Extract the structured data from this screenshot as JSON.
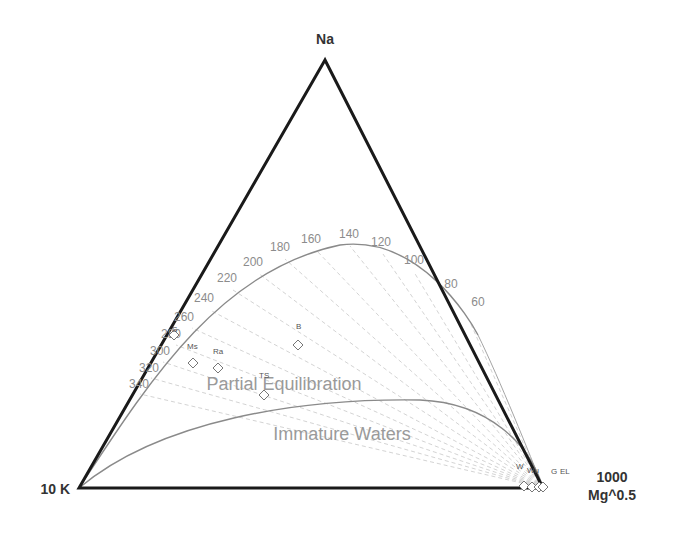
{
  "diagram": {
    "type": "ternary",
    "vertices": {
      "top": "Na",
      "bottom_left": "10 K",
      "bottom_right_line1": "1000",
      "bottom_right_line2": "Mg^0.5"
    },
    "regions": {
      "partial": "Partial Equilibration",
      "immature": "Immature Waters"
    },
    "temperature_labels": [
      {
        "label": "60",
        "x": 478,
        "y": 306
      },
      {
        "label": "80",
        "x": 451,
        "y": 288
      },
      {
        "label": "100",
        "x": 414,
        "y": 264
      },
      {
        "label": "120",
        "x": 381,
        "y": 246
      },
      {
        "label": "140",
        "x": 349,
        "y": 238
      },
      {
        "label": "160",
        "x": 311,
        "y": 243
      },
      {
        "label": "180",
        "x": 280,
        "y": 251
      },
      {
        "label": "200",
        "x": 253,
        "y": 266
      },
      {
        "label": "220",
        "x": 227,
        "y": 282
      },
      {
        "label": "240",
        "x": 204,
        "y": 302
      },
      {
        "label": "260",
        "x": 184,
        "y": 321
      },
      {
        "label": "280",
        "x": 171,
        "y": 338
      },
      {
        "label": "300",
        "x": 160,
        "y": 355
      },
      {
        "label": "320",
        "x": 149,
        "y": 372
      },
      {
        "label": "340",
        "x": 139,
        "y": 388
      }
    ],
    "samples": [
      {
        "label": "S",
        "x": 174,
        "y": 335,
        "lx": 172,
        "ly": 332
      },
      {
        "label": "Ms",
        "x": 193,
        "y": 363,
        "lx": 187,
        "ly": 349
      },
      {
        "label": "Ra",
        "x": 218,
        "y": 368,
        "lx": 213,
        "ly": 354
      },
      {
        "label": "B",
        "x": 298,
        "y": 345,
        "lx": 296,
        "ly": 329
      },
      {
        "label": "TS",
        "x": 264,
        "y": 395,
        "lx": 259,
        "ly": 378
      },
      {
        "label": "W",
        "x": 524,
        "y": 486,
        "lx": 516,
        "ly": 469
      },
      {
        "label": "Wu",
        "x": 532,
        "y": 487,
        "lx": 527,
        "ly": 473
      },
      {
        "label": "G",
        "x": 539,
        "y": 487,
        "lx": 551,
        "ly": 474
      },
      {
        "label": "EL",
        "x": 543,
        "y": 487,
        "lx": 560,
        "ly": 474
      }
    ]
  },
  "colors": {
    "triangle": "#1a1a1a",
    "curves": "#8a8a8a",
    "isotherms": "#c4c4c4",
    "temperature_text": "#8c8c8c",
    "region_text": "#9a9a9a",
    "marker": "#777777"
  }
}
